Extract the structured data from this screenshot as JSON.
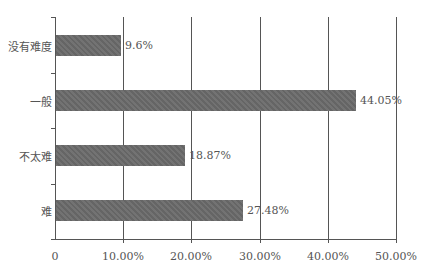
{
  "chart_data": {
    "type": "bar",
    "orientation": "horizontal",
    "title": "",
    "xlabel": "",
    "ylabel": "",
    "categories": [
      "没有难度",
      "一般",
      "不太难",
      "难"
    ],
    "values": [
      9.6,
      44.05,
      18.87,
      27.48
    ],
    "value_labels": [
      "9.6%",
      "44.05%",
      "18.87%",
      "27.48%"
    ],
    "xlim": [
      0,
      50
    ],
    "x_ticks": [
      "0",
      "10.00%",
      "20.00%",
      "30.00%",
      "40.00%",
      "50.00%"
    ],
    "grid": true,
    "legend": null,
    "bar_color": "#6a6a6a"
  }
}
